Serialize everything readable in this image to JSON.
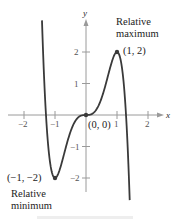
{
  "chart_data": {
    "type": "line",
    "title": "",
    "function": "f(x) = 5x^3 - 3x^5",
    "xlabel": "x",
    "ylabel": "y",
    "xlim": [
      -2.5,
      2.5
    ],
    "ylim": [
      -2.5,
      3
    ],
    "x_ticks": [
      -2,
      -1,
      1,
      2
    ],
    "x_tick_labels": [
      "−2",
      "−1",
      "1",
      "2"
    ],
    "y_ticks": [
      -2,
      -1,
      1,
      2
    ],
    "y_tick_labels": [
      "−2",
      "−1",
      "1",
      "2"
    ],
    "grid": false,
    "series": [
      {
        "name": "f(x)",
        "x": [
          -1.42,
          -1.3,
          -1.2,
          -1.1,
          -1.0,
          -0.9,
          -0.8,
          -0.6,
          -0.4,
          -0.2,
          0,
          0.2,
          0.4,
          0.6,
          0.8,
          0.9,
          1.0,
          1.1,
          1.2,
          1.3,
          1.41
        ],
        "values": [
          2.85,
          0.15,
          -1.33,
          -1.9,
          -2.0,
          -1.88,
          -1.58,
          -0.85,
          -0.29,
          -0.04,
          0,
          0.04,
          0.29,
          0.85,
          1.58,
          1.88,
          2.0,
          1.9,
          1.33,
          -0.15,
          -2.54
        ]
      }
    ],
    "points": [
      {
        "x": 1,
        "y": 2,
        "label": "(1, 2)",
        "annotation": "Relative maximum"
      },
      {
        "x": 0,
        "y": 0,
        "label": "(0, 0)",
        "annotation": ""
      },
      {
        "x": -1,
        "y": -2,
        "label": "(−1, −2)",
        "annotation": "Relative minimum"
      }
    ]
  },
  "labels": {
    "x_axis": "x",
    "y_axis": "y",
    "max_point": "(1, 2)",
    "max_line1": "Relative",
    "max_line2": "maximum",
    "origin_point": "(0, 0)",
    "min_point": "(−1, −2)",
    "min_line1": "Relative",
    "min_line2": "minimum",
    "xt_m2": "−2",
    "xt_m1": "−1",
    "xt_1": "1",
    "xt_2": "2",
    "yt_2": "2",
    "yt_1": "1",
    "yt_m1": "−1",
    "yt_m2": "−2"
  }
}
